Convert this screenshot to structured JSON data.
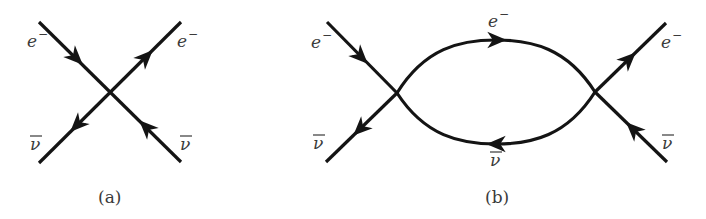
{
  "diagrams": {
    "a": {
      "caption": "(a)",
      "labels": {
        "top_left": "e",
        "top_left_sup": "−",
        "top_right": "e",
        "top_right_sup": "−",
        "bottom_left": "ν",
        "bottom_right": "ν"
      }
    },
    "b": {
      "caption": "(b)",
      "labels": {
        "top_left": "e",
        "top_left_sup": "−",
        "top_right": "e",
        "top_right_sup": "−",
        "bottom_left": "ν",
        "bottom_right": "ν",
        "loop_top": "e",
        "loop_top_sup": "−",
        "loop_bottom": "ν"
      }
    }
  },
  "colors": {
    "line": "#141414",
    "text": "#3a3a3a",
    "background": "#ffffff"
  }
}
